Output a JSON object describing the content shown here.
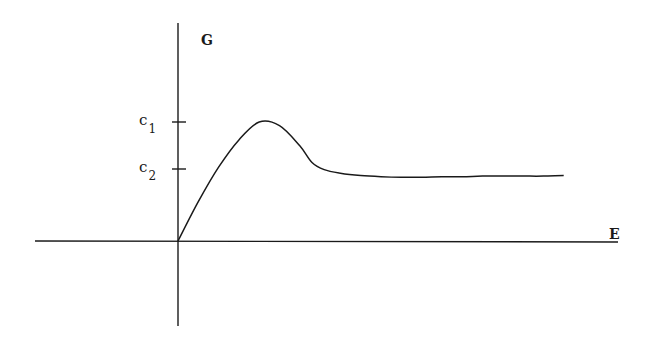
{
  "chart_data": {
    "type": "line",
    "title": "",
    "xlabel": "E",
    "ylabel": "G",
    "y_ticks": [
      {
        "label": "c1",
        "base": "c",
        "sub": "1",
        "value": 1.0
      },
      {
        "label": "c2",
        "base": "c",
        "sub": "2",
        "value": 0.6
      }
    ],
    "x_ticks": [],
    "grid": false,
    "legend": null,
    "series": [
      {
        "name": "G(E)",
        "x": [
          0,
          0.5,
          1.0,
          1.5,
          2.0,
          2.5,
          3.0,
          3.3,
          3.6,
          4.0,
          4.5,
          5.0,
          5.5,
          6.0,
          6.5,
          7.0,
          7.5,
          8.0,
          8.5,
          9.0,
          9.5
        ],
        "y": [
          0,
          0.33,
          0.62,
          0.85,
          1.0,
          0.97,
          0.8,
          0.66,
          0.6,
          0.57,
          0.55,
          0.54,
          0.535,
          0.535,
          0.54,
          0.54,
          0.545,
          0.545,
          0.545,
          0.545,
          0.55
        ]
      }
    ],
    "annotations": [
      "curve rises from origin to maximum c1, then decays and levels off slightly below c2"
    ],
    "xlim": [
      -3.3,
      10.4
    ],
    "ylim": [
      -0.75,
      1.85
    ]
  },
  "labels": {
    "y_axis": "G",
    "x_axis": "E",
    "c1_base": "c",
    "c1_sub": "1",
    "c2_base": "c",
    "c2_sub": "2"
  },
  "colors": {
    "ink": "#1a1a1a",
    "background": "#ffffff"
  }
}
